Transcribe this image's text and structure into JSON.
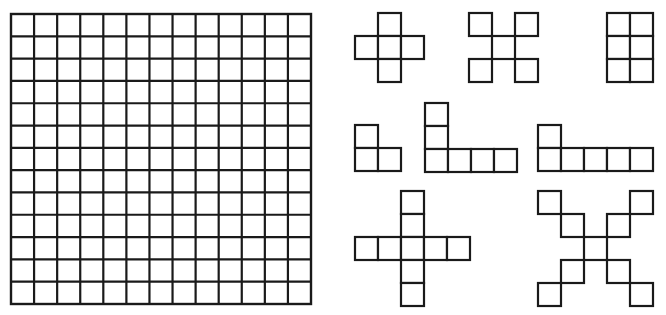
{
  "board": {
    "rows": 13,
    "cols": 13,
    "x": 11,
    "y": 14,
    "width": 300,
    "height": 290,
    "line_color": "#1a1a1a"
  },
  "pieces": [
    {
      "name": "small-plus-pentomino",
      "origin": [
        355,
        13
      ],
      "cell": 23,
      "cells": [
        [
          1,
          0
        ],
        [
          0,
          1
        ],
        [
          1,
          1
        ],
        [
          2,
          1
        ],
        [
          1,
          2
        ]
      ]
    },
    {
      "name": "small-x-pentomino",
      "origin": [
        469,
        13
      ],
      "cell": 23,
      "cells": [
        [
          0,
          0
        ],
        [
          2,
          0
        ],
        [
          1,
          1
        ],
        [
          0,
          2
        ],
        [
          2,
          2
        ]
      ]
    },
    {
      "name": "rectangle-2x3",
      "origin": [
        607,
        13
      ],
      "cell": 23,
      "cells": [
        [
          0,
          0
        ],
        [
          1,
          0
        ],
        [
          0,
          1
        ],
        [
          1,
          1
        ],
        [
          0,
          2
        ],
        [
          1,
          2
        ]
      ]
    },
    {
      "name": "small-l-tromino",
      "origin": [
        355,
        125
      ],
      "cell": 23,
      "cells": [
        [
          0,
          0
        ],
        [
          0,
          1
        ],
        [
          1,
          1
        ]
      ]
    },
    {
      "name": "tall-l-hexomino",
      "origin": [
        425,
        103
      ],
      "cell": 23,
      "cells": [
        [
          0,
          0
        ],
        [
          0,
          1
        ],
        [
          0,
          2
        ],
        [
          1,
          2
        ],
        [
          2,
          2
        ],
        [
          3,
          2
        ]
      ]
    },
    {
      "name": "long-l-hexomino",
      "origin": [
        538,
        125
      ],
      "cell": 23,
      "cells": [
        [
          0,
          0
        ],
        [
          0,
          1
        ],
        [
          1,
          1
        ],
        [
          2,
          1
        ],
        [
          3,
          1
        ],
        [
          4,
          1
        ]
      ]
    },
    {
      "name": "large-plus-nonomino",
      "origin": [
        355,
        191
      ],
      "cell": 23,
      "cells": [
        [
          2,
          0
        ],
        [
          2,
          1
        ],
        [
          0,
          2
        ],
        [
          1,
          2
        ],
        [
          2,
          2
        ],
        [
          3,
          2
        ],
        [
          4,
          2
        ],
        [
          2,
          3
        ],
        [
          2,
          4
        ]
      ]
    },
    {
      "name": "large-x-nonomino",
      "origin": [
        538,
        191
      ],
      "cell": 23,
      "cells": [
        [
          0,
          0
        ],
        [
          4,
          0
        ],
        [
          1,
          1
        ],
        [
          3,
          1
        ],
        [
          2,
          2
        ],
        [
          1,
          3
        ],
        [
          3,
          3
        ],
        [
          0,
          4
        ],
        [
          4,
          4
        ]
      ]
    }
  ]
}
